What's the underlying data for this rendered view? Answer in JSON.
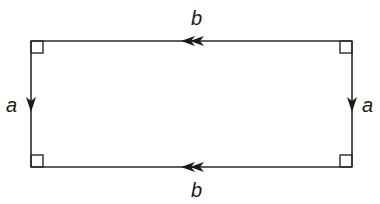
{
  "diagram": {
    "type": "rectangle-identification",
    "rectangle": {
      "left": 31,
      "top": 41,
      "right": 352,
      "bottom": 167
    },
    "corner_markers": [
      "top-left",
      "top-right",
      "bottom-left",
      "bottom-right"
    ],
    "edges": [
      {
        "id": "top",
        "label": "b",
        "arrow": "double",
        "direction": "left"
      },
      {
        "id": "bottom",
        "label": "b",
        "arrow": "double",
        "direction": "left"
      },
      {
        "id": "left",
        "label": "a",
        "arrow": "single",
        "direction": "down"
      },
      {
        "id": "right",
        "label": "a",
        "arrow": "single",
        "direction": "down"
      }
    ],
    "labels": {
      "top": "b",
      "bottom": "b",
      "left": "a",
      "right": "a"
    }
  }
}
